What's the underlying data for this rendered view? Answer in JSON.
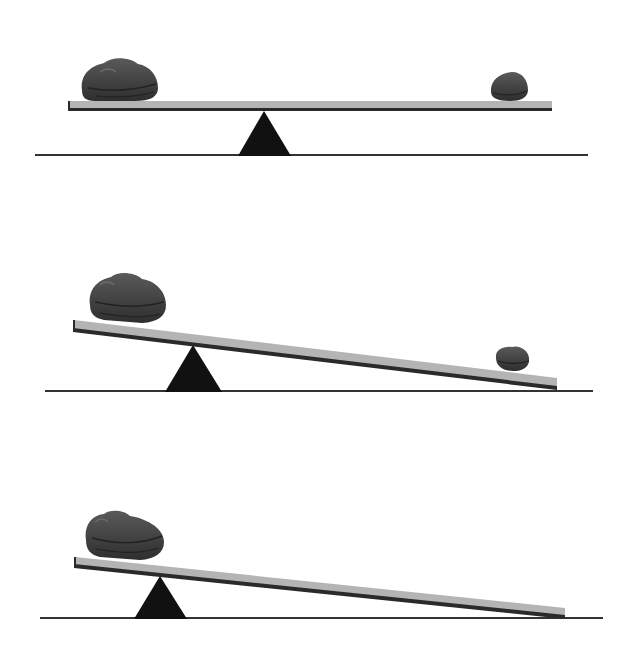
{
  "diagram": {
    "type": "seesaw-lever-illustration",
    "colors": {
      "background": "#ffffff",
      "plank": "#b4b4b4",
      "plank_edge": "#2a2a2a",
      "fulcrum": "#111111",
      "ground": "#333333",
      "rock": "#4a4a4a",
      "rock_dark": "#2c2c2c"
    },
    "panels": [
      {
        "name": "balanced",
        "large_rock": true,
        "small_rock": true,
        "fulcrum_position": "center",
        "tilt": "level"
      },
      {
        "name": "fulcrum-shifted-left",
        "large_rock": true,
        "small_rock": true,
        "fulcrum_position": "left",
        "tilt": "right-end-down"
      },
      {
        "name": "fulcrum-near-large-rock",
        "large_rock": true,
        "small_rock": false,
        "fulcrum_position": "far-left",
        "tilt": "right-end-down"
      }
    ]
  }
}
